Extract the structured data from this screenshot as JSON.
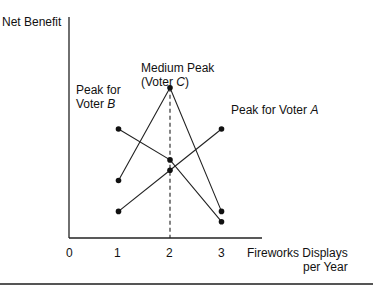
{
  "chart_data": {
    "type": "line",
    "title": "",
    "xlabel": "Fireworks Displays per Year",
    "ylabel": "Net Benefit",
    "x_ticks": [
      "0",
      "1",
      "2",
      "3"
    ],
    "x": [
      1,
      2,
      3
    ],
    "series": [
      {
        "name": "Voter A",
        "values": [
          1,
          3,
          5
        ],
        "peak_at": 3
      },
      {
        "name": "Voter B",
        "values": [
          5,
          3.5,
          0.5
        ],
        "peak_at": 1
      },
      {
        "name": "Voter C",
        "values": [
          2.5,
          7,
          1
        ],
        "peak_at": 2
      }
    ],
    "annotations": [
      {
        "text": "Medium Peak (Voter C)",
        "at": [
          2,
          7
        ]
      },
      {
        "text": "Peak for Voter B",
        "at": [
          1,
          5
        ]
      },
      {
        "text": "Peak for Voter A",
        "at": [
          3,
          5
        ]
      }
    ],
    "median_line_x": 2,
    "grid": false,
    "y_ticks": []
  },
  "labels": {
    "ylabel": "Net Benefit",
    "xlabel_line1": "Fireworks Displays",
    "xlabel_line2": "per Year",
    "tick0": "0",
    "tick1": "1",
    "tick2": "2",
    "tick3": "3",
    "c_line1": "Medium Peak",
    "c_line2_pre": "(Voter ",
    "c_letter": "C",
    "c_line2_post": ")",
    "b_line1": "Peak for",
    "b_line2_pre": "Voter ",
    "b_letter": "B",
    "a_pre": "Peak for Voter ",
    "a_letter": "A"
  },
  "colors": {
    "ink": "#111111",
    "rule": "#555555"
  }
}
